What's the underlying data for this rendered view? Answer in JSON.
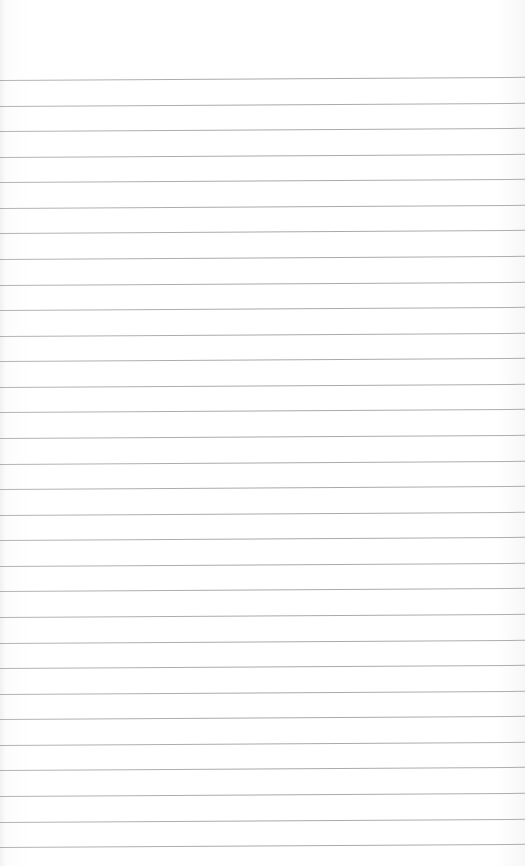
{
  "page": {
    "type": "lined-paper",
    "background_color": "#ffffff",
    "line_color": "#8c8c8c",
    "first_line_y": 80,
    "line_spacing": 25.57,
    "line_count": 31
  }
}
